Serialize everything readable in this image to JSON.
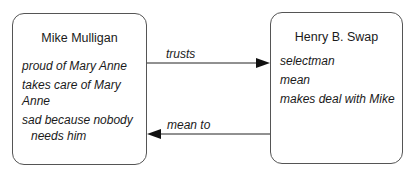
{
  "nodes": [
    {
      "id": "mike",
      "title": "Mike Mulligan",
      "attributes": [
        "proud of Mary Anne",
        "takes care of Mary Anne",
        "sad because nobody",
        "needs him"
      ]
    },
    {
      "id": "henry",
      "title": "Henry B. Swap",
      "attributes": [
        "selectman",
        "mean",
        "makes deal with Mike"
      ]
    }
  ],
  "edges": [
    {
      "from": "mike",
      "to": "henry",
      "label": "trusts"
    },
    {
      "from": "henry",
      "to": "mike",
      "label": "mean to"
    }
  ]
}
